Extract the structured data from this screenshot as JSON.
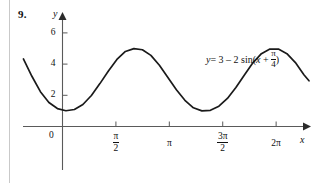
{
  "figure": {
    "problem_number": "9.",
    "equation_parts": {
      "lhs": "y",
      "eq": "= 3 ",
      "minus": "–",
      "coef": " 2 sin(",
      "arg_x": "x",
      "plus": " + ",
      "frac_num": "π",
      "frac_den": "4",
      "close": ")"
    },
    "axis_labels": {
      "x": "x",
      "y": "y"
    },
    "origin_label": "0",
    "y_ticks": [
      {
        "value": 2,
        "label": "2"
      },
      {
        "value": 4,
        "label": "4"
      },
      {
        "value": 6,
        "label": "6"
      }
    ],
    "x_ticks": [
      {
        "value": 1.5707963,
        "num": "π",
        "den": "2",
        "is_fraction": true
      },
      {
        "value": 3.1415927,
        "label": "π",
        "is_fraction": false
      },
      {
        "value": 4.712389,
        "num": "3π",
        "den": "2",
        "is_fraction": true
      },
      {
        "value": 6.2831853,
        "label": "2π",
        "is_fraction": false
      }
    ],
    "curve_color": "#1a1a1a",
    "axis_color": "#5a5a5a"
  },
  "chart_data": {
    "type": "line",
    "title": "",
    "xlabel": "x",
    "ylabel": "y",
    "equation": "y = 3 - 2 sin(x + pi/4)",
    "amplitude": 2,
    "vertical_shift": 3,
    "phase_shift": 0.7853982,
    "period": 6.2831853,
    "xlim": [
      -1.15,
      7.25
    ],
    "ylim": [
      -0.55,
      7.1
    ],
    "grid": false,
    "legend": "none",
    "y_tick_values": [
      2,
      4,
      6
    ],
    "x_tick_values": [
      1.5707963,
      3.1415927,
      4.712389,
      6.2831853
    ],
    "x_tick_labels": [
      "π/2",
      "π",
      "3π/2",
      "2π"
    ],
    "annotations": [
      {
        "text": "y = 3 – 2 sin(x + π/4)",
        "x": 4.6,
        "y": 4.85
      }
    ],
    "key_points": [
      {
        "x": -1.15,
        "y": 4.33,
        "note": "left edge of plotted curve"
      },
      {
        "x": -0.7853982,
        "y": 3.0,
        "note": "descending midline crossing"
      },
      {
        "x": 0.7853982,
        "y": 1.0,
        "note": "minimum"
      },
      {
        "x": 2.3561945,
        "y": 3.0,
        "note": "ascending midline crossing"
      },
      {
        "x": 3.9269908,
        "y": 5.0,
        "note": "maximum"
      },
      {
        "x": 5.4977871,
        "y": 3.0,
        "note": "descending midline crossing"
      },
      {
        "x": 7.0685835,
        "y": 1.0,
        "note": "minimum"
      },
      {
        "x": 7.25,
        "y": 1.03,
        "note": "right edge of plotted curve"
      }
    ],
    "series": [
      {
        "name": "y = 3 - 2 sin(x + pi/4)",
        "x": [
          -1.15,
          -0.9,
          -0.65,
          -0.4,
          -0.15,
          0.1,
          0.35,
          0.6,
          0.85,
          1.1,
          1.35,
          1.6,
          1.85,
          2.1,
          2.35,
          2.6,
          2.85,
          3.1,
          3.35,
          3.6,
          3.85,
          4.1,
          4.35,
          4.6,
          4.85,
          5.1,
          5.35,
          5.6,
          5.85,
          6.1,
          6.35,
          6.6,
          6.85,
          7.1,
          7.25
        ],
        "y": [
          4.33,
          3.22,
          2.23,
          1.54,
          1.15,
          1.01,
          1.09,
          1.41,
          1.99,
          2.75,
          3.56,
          4.3,
          4.81,
          4.99,
          4.92,
          4.56,
          3.93,
          3.14,
          2.36,
          1.68,
          1.2,
          1.0,
          1.04,
          1.3,
          1.8,
          2.5,
          3.3,
          4.08,
          4.67,
          4.96,
          4.96,
          4.67,
          4.1,
          3.32,
          2.93
        ]
      }
    ]
  }
}
